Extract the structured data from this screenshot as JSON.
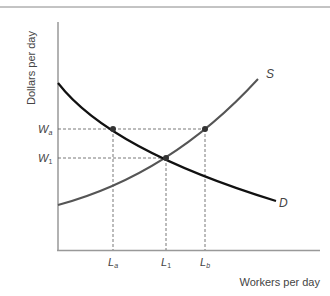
{
  "figure": {
    "y_axis_label": "Dollars per day",
    "x_axis_label": "Workers per day",
    "y_ticks": [
      {
        "main": "W",
        "sub": "a",
        "name": "wage-a"
      },
      {
        "main": "W",
        "sub": "1",
        "name": "wage-1"
      }
    ],
    "x_ticks": [
      {
        "main": "L",
        "sub": "a",
        "name": "labor-a"
      },
      {
        "main": "L",
        "sub": "1",
        "name": "labor-1"
      },
      {
        "main": "L",
        "sub": "b",
        "name": "labor-b"
      }
    ],
    "curves": [
      {
        "label": "S",
        "name": "supply-curve",
        "color": "#555555"
      },
      {
        "label": "D",
        "name": "demand-curve",
        "color": "#111111"
      }
    ]
  }
}
